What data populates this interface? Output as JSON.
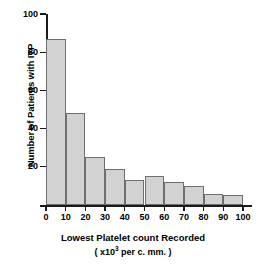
{
  "chart_data": {
    "type": "bar",
    "title": "",
    "xlabel": "Lowest Platelet count Recorded",
    "xlabel_sub_prefix": "( x10",
    "xlabel_sub_exponent": "3",
    "xlabel_sub_suffix": " per c. mm. )",
    "ylabel": "Number of Patients with ITP",
    "categories": [
      "0-10",
      "10-20",
      "20-30",
      "30-40",
      "40-50",
      "50-60",
      "60-70",
      "70-80",
      "80-90",
      "90-100"
    ],
    "bin_edges": [
      0,
      10,
      20,
      30,
      40,
      50,
      60,
      70,
      80,
      90,
      100
    ],
    "values": [
      87,
      48,
      25,
      19,
      13,
      15,
      12,
      10,
      6,
      5
    ],
    "xlim": [
      0,
      100
    ],
    "ylim": [
      0,
      100
    ],
    "xticks": [
      "0",
      "10",
      "20",
      "30",
      "40",
      "50",
      "60",
      "70",
      "80",
      "90",
      "100"
    ],
    "yticks": [
      "20",
      "40",
      "60",
      "80",
      "100"
    ],
    "grid": false,
    "legend": "none",
    "colors": {
      "bar_fill": "#d2d2d2",
      "bar_edge": "#6e6e6e",
      "axis": "#1a1a1a",
      "background": "#ffffff",
      "text": "#000000"
    }
  }
}
